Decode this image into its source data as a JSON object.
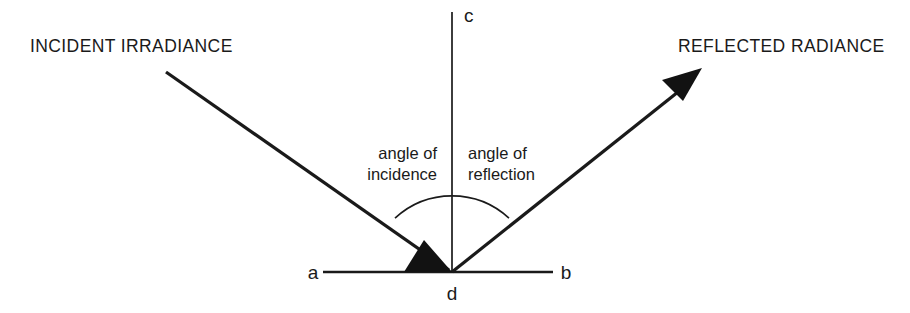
{
  "figure": {
    "type": "optics-reflection-diagram",
    "title_visible": false,
    "background_color": "#ffffff",
    "stroke_color": "#1a1a1a",
    "width": 910,
    "height": 313
  },
  "labels": {
    "incident_beam": "INCIDENT IRRADIANCE",
    "reflected_beam": "REFLECTED RADIANCE",
    "angle_of_incidence_line1": "angle of",
    "angle_of_incidence_line2": "incidence",
    "angle_of_reflection_line1": "angle of",
    "angle_of_reflection_line2": "reflection",
    "point_a": "a",
    "point_b": "b",
    "point_c": "c",
    "point_d": "d"
  },
  "geometry": {
    "origin": {
      "x": 452,
      "y": 272
    },
    "normal_top": {
      "x": 452,
      "y": 12
    },
    "surface_left": {
      "x": 323,
      "y": 272
    },
    "surface_right": {
      "x": 553,
      "y": 272
    },
    "incident_start": {
      "x": 166,
      "y": 72
    },
    "reflected_end": {
      "x": 700,
      "y": 70
    },
    "arc_radius": 84,
    "incident_angle_degrees": 43,
    "reflection_angle_degrees": 43
  }
}
